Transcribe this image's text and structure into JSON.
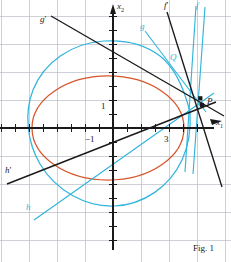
{
  "figure": {
    "caption": "Fig. 1",
    "width": 231,
    "height": 262,
    "colors": {
      "axis": "#1a1a1a",
      "grid": "#b9bcc6",
      "ellipse": "#d4552b",
      "cyan": "#31b4dd",
      "background": "#ffffff"
    }
  },
  "axes": {
    "x_label": "x",
    "x_sub": "1",
    "y_label": "x",
    "y_sub": "2",
    "origin": {
      "x": 113,
      "y": 128
    },
    "unit_px": 14,
    "grid_px": 28,
    "ticks": {
      "x_labeled": [
        {
          "text": "−1",
          "value": -1,
          "px_x": 90,
          "px_y": 140
        },
        {
          "text": "3",
          "value": 3,
          "px_x": 166,
          "px_y": 140
        }
      ],
      "y_labeled": [
        {
          "text": "1",
          "value": 1,
          "px_x": 104,
          "px_y": 108
        }
      ]
    }
  },
  "labels": [
    {
      "name": "g-prime",
      "text": "g",
      "prime": "′",
      "color": "black",
      "x": 40,
      "y": 18,
      "size": 9
    },
    {
      "name": "f-prime",
      "text": "f",
      "prime": "′",
      "color": "black",
      "x": 164,
      "y": 2,
      "size": 9
    },
    {
      "name": "f",
      "text": "f",
      "prime": "",
      "color": "cyan",
      "x": 196,
      "y": 2,
      "size": 9
    },
    {
      "name": "g",
      "text": "g",
      "prime": "",
      "color": "cyan",
      "x": 140,
      "y": 24,
      "size": 9
    },
    {
      "name": "Q",
      "text": "Q",
      "prime": "",
      "color": "cyan",
      "x": 170,
      "y": 55,
      "size": 9
    },
    {
      "name": "P",
      "text": "P",
      "prime": "",
      "color": "black",
      "x": 208,
      "y": 98,
      "size": 9
    },
    {
      "name": "h-prime",
      "text": "h",
      "prime": "′",
      "color": "black",
      "x": 6,
      "y": 168,
      "size": 9
    },
    {
      "name": "h",
      "text": "h",
      "prime": "",
      "color": "cyan",
      "x": 27,
      "y": 205,
      "size": 9
    }
  ],
  "curves": {
    "ellipse": {
      "name": "conic-ellipse-orange",
      "color": "#d4552b",
      "cx": 108,
      "cy": 128,
      "rx": 77,
      "ry": 53
    },
    "cyan_conic": {
      "name": "conic-cyan",
      "color": "#31b4dd",
      "cx": 110,
      "cy": 124,
      "rx": 80,
      "ry": 82
    }
  },
  "lines": [
    {
      "name": "line-g-prime",
      "color": "black",
      "x1": 51,
      "y1": 17,
      "x2": 222,
      "y2": 114
    },
    {
      "name": "line-f-prime",
      "color": "black",
      "x1": 168,
      "y1": 12,
      "x2": 221,
      "y2": 188
    },
    {
      "name": "line-h-prime",
      "color": "black",
      "x1": 8,
      "y1": 183,
      "x2": 214,
      "y2": 103
    },
    {
      "name": "line-f-cyan",
      "color": "cyan",
      "x1": 197,
      "y1": 8,
      "x2": 186,
      "y2": 170
    },
    {
      "name": "line-f-cyan-2",
      "color": "cyan",
      "x1": 204,
      "y1": 8,
      "x2": 192,
      "y2": 172
    },
    {
      "name": "line-g-cyan",
      "color": "cyan",
      "x1": 146,
      "y1": 30,
      "x2": 199,
      "y2": 102
    },
    {
      "name": "line-h-cyan",
      "color": "cyan",
      "x1": 35,
      "y1": 218,
      "x2": 213,
      "y2": 93
    }
  ],
  "points": [
    {
      "name": "point-P",
      "x": 203,
      "y": 105,
      "r": 2.4
    },
    {
      "name": "point-Q",
      "x": 200,
      "y": 98,
      "r": 2.2
    }
  ]
}
